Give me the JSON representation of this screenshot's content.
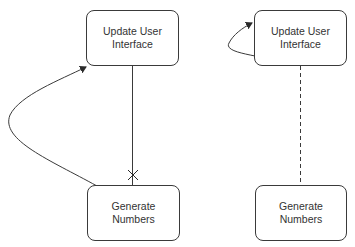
{
  "diagram": {
    "left": {
      "top_node": {
        "label": "Update User\nInterface"
      },
      "bottom_node": {
        "label": "Generate\nNumbers"
      },
      "edges": [
        {
          "from": "Generate Numbers",
          "to": "Update User Interface",
          "style": "solid",
          "shape": "curved-arrow"
        },
        {
          "from": "Update User Interface",
          "to": "Generate Numbers",
          "style": "solid",
          "end_marker": "cross"
        }
      ]
    },
    "right": {
      "top_node": {
        "label": "Update User\nInterface"
      },
      "bottom_node": {
        "label": "Generate\nNumbers"
      },
      "edges": [
        {
          "from": "Update User Interface",
          "to": "Update User Interface",
          "style": "solid",
          "shape": "self-loop-arrow"
        },
        {
          "from": "Update User Interface",
          "to": "Generate Numbers",
          "style": "dashed"
        }
      ]
    },
    "colors": {
      "stroke": "#3a3a3a",
      "text": "#333333",
      "background": "#ffffff"
    }
  }
}
